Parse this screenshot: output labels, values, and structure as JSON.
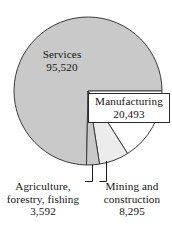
{
  "chart_data": {
    "type": "pie",
    "title": "",
    "subtitle": "",
    "xlabel": "",
    "ylabel": "",
    "legend_position": "none",
    "grid": false,
    "total": 127900,
    "categories": [
      "Services",
      "Manufacturing",
      "Mining and construction",
      "Agriculture, forestry, fishing"
    ],
    "values": [
      95520,
      20493,
      8295,
      3592
    ],
    "slices": [
      {
        "name": "Services",
        "label_line1": "Services",
        "label_line2": "95,520",
        "value": 95520,
        "percent": 74.7,
        "start_angle": 91.1,
        "end_angle": 360,
        "color": "#c9c9c9",
        "label_placement": "inside"
      },
      {
        "name": "Manufacturing",
        "label_line1": "Manufacturing",
        "label_line2": "20,493",
        "value": 20493,
        "percent": 16.0,
        "start_angle": 0,
        "end_angle": 57.7,
        "color": "#ffffff",
        "label_placement": "boxed-right"
      },
      {
        "name": "Mining and construction",
        "label_line1": "Mining and",
        "label_line2": "construction",
        "label_line3": "8,295",
        "value": 8295,
        "percent": 6.5,
        "start_angle": 57.7,
        "end_angle": 81.0,
        "color": "#ececec",
        "label_placement": "leader-bottom-right"
      },
      {
        "name": "Agriculture, forestry, fishing",
        "label_line1": "Agriculture,",
        "label_line2": "forestry, fishing",
        "label_line3": "3,592",
        "value": 3592,
        "percent": 2.8,
        "start_angle": 81.0,
        "end_angle": 91.1,
        "color": "#c9c9c9",
        "label_placement": "leader-bottom-left"
      }
    ]
  },
  "labels": {
    "services": {
      "line1": "Services",
      "line2": "95,520"
    },
    "manufacturing": {
      "line1": "Manufacturing",
      "line2": "20,493"
    },
    "agriculture": {
      "line1": "Agriculture,",
      "line2": "forestry, fishing",
      "line3": "3,592"
    },
    "mining": {
      "line1": "Mining and",
      "line2": "construction",
      "line3": "8,295"
    }
  },
  "colors": {
    "services_fill": "#c9c9c9",
    "manufacturing_fill": "#ffffff",
    "mining_fill": "#ececec",
    "agriculture_fill": "#c9c9c9",
    "outline": "#3a3a3a",
    "text": "#141414",
    "background": "#ffffff"
  }
}
